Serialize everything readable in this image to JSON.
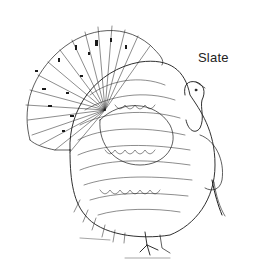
{
  "illustration": {
    "subject": "turkey",
    "style": "pen-and-ink line drawing",
    "label": "Slate"
  },
  "colors": {
    "ink": "#1a1a1a",
    "background": "#ffffff"
  }
}
